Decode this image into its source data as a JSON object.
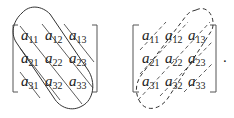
{
  "figure": {
    "left_matrix": {
      "outline_style": "solid",
      "diagonal_direction": "main (top-left to bottom-right)",
      "rows": [
        [
          {
            "base": "a",
            "sub": "11"
          },
          {
            "base": "a",
            "sub": "12"
          },
          {
            "base": "a",
            "sub": "13"
          }
        ],
        [
          {
            "base": "a",
            "sub": "21"
          },
          {
            "base": "a",
            "sub": "22"
          },
          {
            "base": "a",
            "sub": "23"
          }
        ],
        [
          {
            "base": "a",
            "sub": "31"
          },
          {
            "base": "a",
            "sub": "32"
          },
          {
            "base": "a",
            "sub": "33"
          }
        ]
      ]
    },
    "right_matrix": {
      "outline_style": "dashed",
      "diagonal_direction": "anti (bottom-left to top-right)",
      "rows": [
        [
          {
            "base": "a",
            "sub": "11"
          },
          {
            "base": "a",
            "sub": "12"
          },
          {
            "base": "a",
            "sub": "13"
          }
        ],
        [
          {
            "base": "a",
            "sub": "21"
          },
          {
            "base": "a",
            "sub": "22"
          },
          {
            "base": "a",
            "sub": "23"
          }
        ],
        [
          {
            "base": "a",
            "sub": "31"
          },
          {
            "base": "a",
            "sub": "32"
          },
          {
            "base": "a",
            "sub": "33"
          }
        ]
      ]
    },
    "trailing_punctuation": ".",
    "colors": {
      "ink": "#222222",
      "bracket": "#555555",
      "background": "#ffffff"
    }
  }
}
